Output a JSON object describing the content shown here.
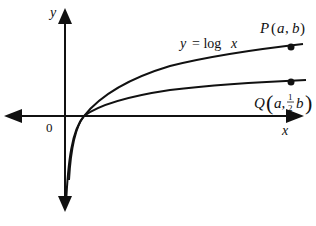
{
  "diagram": {
    "axes": {
      "x_label": "x",
      "y_label": "y",
      "origin_label": "0"
    },
    "curves": [
      {
        "name": "y = log x",
        "label": "y = log x",
        "point_label": "P(a, b)"
      },
      {
        "name": "y = (1/2) log x",
        "point_label_prefix": "Q",
        "point_label": "Q(a, 1/2 b)"
      }
    ],
    "labels": {
      "curve_label_y": "y",
      "curve_label_eq": "= log",
      "curve_label_x": "x",
      "P": "P",
      "P_args_open": "(",
      "P_a": "a",
      "P_comma": ",",
      "P_b": "b",
      "P_args_close": ")",
      "Q": "Q",
      "Q_a": "a,",
      "Q_num": "1",
      "Q_den": "2",
      "Q_b": "b"
    },
    "colors": {
      "stroke": "#111111",
      "background": "#ffffff"
    }
  }
}
